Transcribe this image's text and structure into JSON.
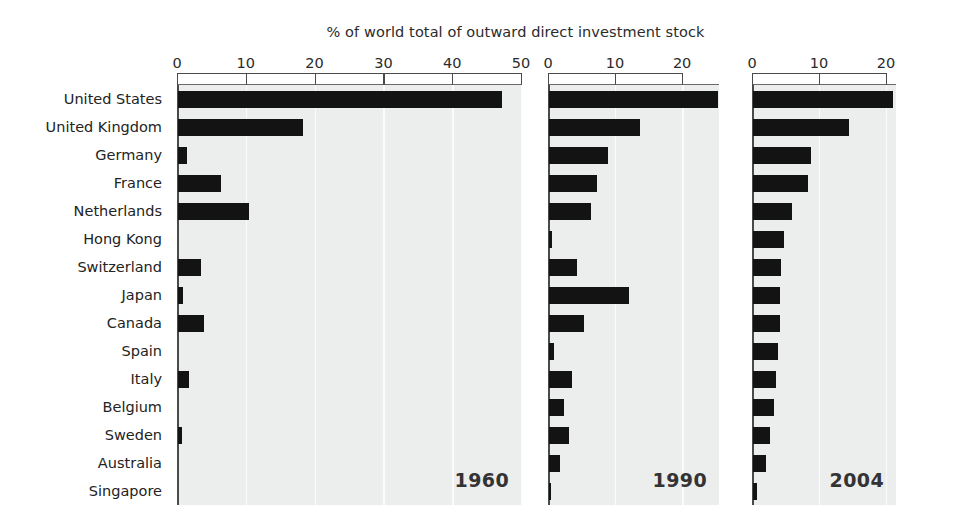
{
  "chart_data": {
    "type": "bar",
    "title": "% of world total of outward direct investment stock",
    "xlabel": "",
    "ylabel": "",
    "orientation": "horizontal",
    "grid": true,
    "legend": "none",
    "panel_label_position": "bottom-right",
    "categories": [
      "United States",
      "United Kingdom",
      "Germany",
      "France",
      "Netherlands",
      "Hong Kong",
      "Switzerland",
      "Japan",
      "Canada",
      "Spain",
      "Italy",
      "Belgium",
      "Sweden",
      "Australia",
      "Singapore"
    ],
    "panels": [
      {
        "label": "1960",
        "xlim": [
          0,
          50
        ],
        "ticks": [
          0,
          10,
          20,
          30,
          40,
          50
        ],
        "tick_labels": [
          "0",
          "10",
          "20",
          "30",
          "40",
          "50"
        ],
        "values": [
          47.1,
          18.1,
          1.3,
          6.3,
          10.3,
          0.0,
          3.4,
          0.7,
          3.8,
          0.0,
          1.6,
          0.0,
          0.6,
          0.0,
          0.0
        ]
      },
      {
        "label": "1990",
        "xlim": [
          0,
          25.5
        ],
        "ticks": [
          0,
          10,
          20
        ],
        "tick_labels": [
          "0",
          "10",
          "20"
        ],
        "values": [
          25.2,
          13.6,
          8.8,
          7.2,
          6.3,
          0.4,
          4.2,
          11.9,
          5.2,
          0.7,
          3.5,
          2.3,
          3.0,
          1.7,
          0.3
        ]
      },
      {
        "label": "2004",
        "xlim": [
          0,
          21.5
        ],
        "ticks": [
          0,
          10,
          20
        ],
        "tick_labels": [
          "0",
          "10",
          "20"
        ],
        "values": [
          20.9,
          14.4,
          8.6,
          8.2,
          5.8,
          4.7,
          4.2,
          4.1,
          4.0,
          3.8,
          3.4,
          3.1,
          2.5,
          2.0,
          0.6
        ]
      }
    ],
    "colors": {
      "bar": "#131313",
      "panel_background": "#eceded",
      "gridline": "#fbfbfb",
      "axis": "#4a4a4a",
      "text": "#232323"
    }
  }
}
